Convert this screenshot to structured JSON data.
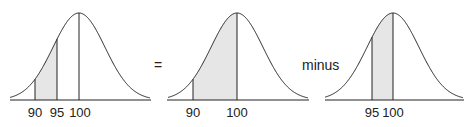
{
  "colors": {
    "curve": "#222222",
    "shade": "#e6e6e6"
  },
  "panels": [
    {
      "id": "p1",
      "ticks": [
        "90",
        "95",
        "100"
      ],
      "shaded": "90 to 95"
    },
    {
      "id": "p2",
      "ticks": [
        "90",
        "100"
      ],
      "shaded": "90 to 100"
    },
    {
      "id": "p3",
      "ticks": [
        "95",
        "100"
      ],
      "shaded": "95 to 100"
    }
  ],
  "operators": {
    "equals": "=",
    "minus": "minus"
  }
}
